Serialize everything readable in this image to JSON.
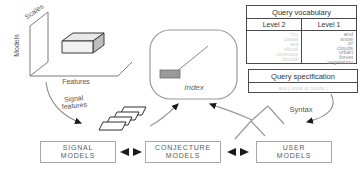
{
  "feature_space": {
    "axis_models": "Models",
    "axis_scales": "Scales",
    "axis_features": "Features"
  },
  "labels": {
    "signal_features_line1": "Signal",
    "signal_features_line2": "features",
    "index": "Index",
    "syntax": "Syntax"
  },
  "query_vocabulary": {
    "title": "Query vocabulary",
    "col_level2": "Level 2",
    "col_level1": "Level 1",
    "level2_terms": [
      "hcv",
      "coastal",
      "arid",
      "alluvial",
      "continuous",
      "bimodal"
    ],
    "level1_terms": [
      "and",
      "snow",
      "or",
      "clouds",
      "urban",
      "forest",
      "vegetation"
    ]
  },
  "query_specification": {
    "title": "Query specification",
    "content": "and ( snow or clouds )"
  },
  "model_boxes": {
    "signal": {
      "line1": "SIGNAL",
      "line2": "MODELS"
    },
    "conjecture": {
      "line1": "CONJECTURE",
      "line2": "MODELS"
    },
    "user": {
      "line1": "USER",
      "line2": "MODELS"
    }
  },
  "colors": {
    "line_gray": "#8a8a8a",
    "border_dark": "#4a4a4a",
    "box_border": "#a8a8a8",
    "arrowhead": "#1a1a1a",
    "cube_side": "#bdbdbd",
    "index_chip": "#9a9a9a"
  }
}
